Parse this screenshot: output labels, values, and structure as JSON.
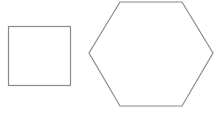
{
  "diagram": {
    "shapes": [
      {
        "type": "square",
        "x": 8,
        "y": 26,
        "width": 62,
        "height": 59,
        "stroke": "#8a8a8a",
        "fill": "#ffffff"
      },
      {
        "type": "hexagon",
        "points": "120,2 182,2 213,53 182,106 120,106 89,53",
        "stroke": "#8a8a8a",
        "fill": "#ffffff"
      }
    ]
  }
}
